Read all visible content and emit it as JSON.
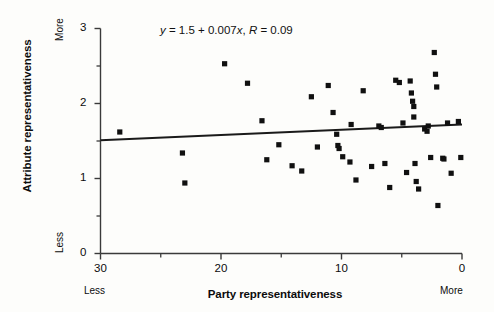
{
  "chart_data": {
    "type": "scatter",
    "title": "",
    "xlabel": "Party representativeness",
    "ylabel": "Attribute representativeness",
    "x_low_caption": "Less",
    "x_high_caption": "More",
    "y_low_caption": "Less",
    "y_high_caption": "More",
    "annotation": "y = 1.5 + 0.007x, R = 0.09",
    "annotation_parts": {
      "y_var": "y",
      "eq1": " = 1.5 + 0.007",
      "x_var": "x",
      "comma": ", ",
      "r_var": "R",
      "eq2": " = 0.09"
    },
    "xlim": [
      30,
      0
    ],
    "ylim": [
      0,
      3
    ],
    "x_axis_reversed": true,
    "xticks": [
      30,
      20,
      10,
      0
    ],
    "xticklabels": [
      "30",
      "20",
      "10",
      "0"
    ],
    "x_minor_ticks": [
      25,
      15,
      5
    ],
    "yticks": [
      0,
      1,
      2,
      3
    ],
    "yticklabels": [
      "0",
      "1",
      "2",
      "3"
    ],
    "y_minor_ticks": [
      0.5,
      1.5,
      2.5
    ],
    "grid": false,
    "legend": false,
    "marker": "square",
    "marker_color": "#101010",
    "line_color": "#1a1a1a",
    "background": "#fdfdfb",
    "fit_line": {
      "intercept": 1.5,
      "slope": 0.007,
      "r": 0.09,
      "x_start": 30,
      "y_start": 1.51,
      "x_end": 0,
      "y_end": 1.72
    },
    "points": [
      {
        "x": 28.4,
        "y": 1.62
      },
      {
        "x": 23.2,
        "y": 1.34
      },
      {
        "x": 23.0,
        "y": 0.94
      },
      {
        "x": 19.7,
        "y": 2.53
      },
      {
        "x": 17.8,
        "y": 2.27
      },
      {
        "x": 16.6,
        "y": 1.77
      },
      {
        "x": 16.2,
        "y": 1.25
      },
      {
        "x": 15.2,
        "y": 1.45
      },
      {
        "x": 14.1,
        "y": 1.17
      },
      {
        "x": 13.3,
        "y": 1.1
      },
      {
        "x": 12.5,
        "y": 2.09
      },
      {
        "x": 12.0,
        "y": 1.42
      },
      {
        "x": 11.1,
        "y": 2.24
      },
      {
        "x": 10.7,
        "y": 1.88
      },
      {
        "x": 10.4,
        "y": 1.59
      },
      {
        "x": 10.3,
        "y": 1.44
      },
      {
        "x": 10.2,
        "y": 1.4
      },
      {
        "x": 9.9,
        "y": 1.29
      },
      {
        "x": 9.2,
        "y": 1.72
      },
      {
        "x": 9.3,
        "y": 1.22
      },
      {
        "x": 8.8,
        "y": 0.98
      },
      {
        "x": 8.2,
        "y": 2.17
      },
      {
        "x": 7.5,
        "y": 1.16
      },
      {
        "x": 6.9,
        "y": 1.7
      },
      {
        "x": 6.7,
        "y": 1.68
      },
      {
        "x": 6.4,
        "y": 1.2
      },
      {
        "x": 6.0,
        "y": 0.88
      },
      {
        "x": 5.5,
        "y": 2.31
      },
      {
        "x": 5.2,
        "y": 2.28
      },
      {
        "x": 4.9,
        "y": 1.74
      },
      {
        "x": 4.6,
        "y": 1.08
      },
      {
        "x": 4.3,
        "y": 2.3
      },
      {
        "x": 4.2,
        "y": 2.14
      },
      {
        "x": 4.1,
        "y": 2.03
      },
      {
        "x": 4.0,
        "y": 1.96
      },
      {
        "x": 4.0,
        "y": 1.82
      },
      {
        "x": 3.9,
        "y": 1.2
      },
      {
        "x": 3.8,
        "y": 0.96
      },
      {
        "x": 3.6,
        "y": 0.86
      },
      {
        "x": 3.1,
        "y": 1.66
      },
      {
        "x": 2.9,
        "y": 1.63
      },
      {
        "x": 2.8,
        "y": 1.7
      },
      {
        "x": 2.6,
        "y": 1.28
      },
      {
        "x": 2.3,
        "y": 2.68
      },
      {
        "x": 2.2,
        "y": 2.39
      },
      {
        "x": 2.1,
        "y": 2.22
      },
      {
        "x": 2.0,
        "y": 0.64
      },
      {
        "x": 1.6,
        "y": 1.27
      },
      {
        "x": 1.5,
        "y": 1.26
      },
      {
        "x": 1.2,
        "y": 1.74
      },
      {
        "x": 0.9,
        "y": 1.07
      },
      {
        "x": 0.3,
        "y": 1.76
      },
      {
        "x": 0.1,
        "y": 1.28
      }
    ]
  }
}
